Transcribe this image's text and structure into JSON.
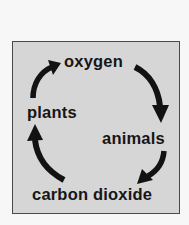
{
  "diagram": {
    "title": "",
    "type": "cycle",
    "nodes": [
      {
        "id": "oxygen",
        "label": "oxygen"
      },
      {
        "id": "animals",
        "label": "animals"
      },
      {
        "id": "carbon_dioxide",
        "label": "carbon dioxide"
      },
      {
        "id": "plants",
        "label": "plants"
      }
    ],
    "edges": [
      {
        "from": "plants",
        "to": "oxygen"
      },
      {
        "from": "oxygen",
        "to": "animals"
      },
      {
        "from": "animals",
        "to": "carbon_dioxide"
      },
      {
        "from": "carbon_dioxide",
        "to": "plants"
      }
    ],
    "colors": {
      "page_background": "#f7f7f7",
      "panel_background": "#d6d6d6",
      "panel_border": "#4a4a4a",
      "text": "#161616",
      "arrow": "#121212"
    }
  }
}
